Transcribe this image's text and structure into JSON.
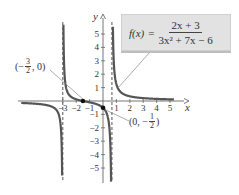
{
  "chart_data": {
    "type": "line",
    "title": "",
    "function_label": {
      "lhs": "f(x)",
      "equals": "=",
      "numerator": "2x + 3",
      "denominator": "3x² + 7x − 6"
    },
    "xlabel": "x",
    "ylabel": "y",
    "xlim": [
      -6,
      6
    ],
    "ylim": [
      -6,
      6
    ],
    "x_ticks": [
      -3,
      -2,
      -1,
      1,
      2,
      3,
      4,
      5
    ],
    "x_tick_labels": [
      "−3",
      "−2",
      "−1",
      "1",
      "2",
      "3",
      "4",
      "5"
    ],
    "y_ticks": [
      5,
      4,
      3,
      2,
      1,
      -1,
      -2,
      -3,
      -4,
      -5
    ],
    "y_tick_labels": [
      "5",
      "4",
      "3",
      "2",
      "1",
      "−1",
      "−2",
      "−3",
      "−4",
      "−5"
    ],
    "vertical_asymptotes": [
      -3,
      0.6667
    ],
    "horizontal_asymptote": 0,
    "grid": false,
    "series": [
      {
        "name": "left branch",
        "domain": [
          -6.1,
          -3
        ],
        "points": [
          [
            -6,
            -0.117
          ],
          [
            -5,
            -0.184
          ],
          [
            -4,
            -0.5
          ],
          [
            -3.5,
            -1.2
          ],
          [
            -3.3,
            -2.4
          ],
          [
            -3.15,
            -5.4
          ]
        ]
      },
      {
        "name": "middle branch",
        "domain": [
          -3,
          0.6667
        ],
        "points": [
          [
            -2.85,
            5.5
          ],
          [
            -2.5,
            1.14
          ],
          [
            -2,
            0.125
          ],
          [
            -1.5,
            0
          ],
          [
            -1,
            -0.1
          ],
          [
            0,
            -0.5
          ],
          [
            0.5,
            -2.67
          ],
          [
            0.6,
            -6.3
          ]
        ]
      },
      {
        "name": "right branch",
        "domain": [
          0.6667,
          5.3
        ],
        "points": [
          [
            0.75,
            5.4
          ],
          [
            1,
            1.25
          ],
          [
            2,
            0.35
          ],
          [
            3,
            0.214
          ],
          [
            4,
            0.15
          ],
          [
            5,
            0.114
          ]
        ]
      }
    ],
    "annotations": [
      {
        "label": "(−3/2, 0)",
        "x": -1.5,
        "y": 0,
        "text_parts": {
          "open": "(−",
          "num": "3",
          "den": "2",
          "close": ", 0)"
        }
      },
      {
        "label": "(0, −1/2)",
        "x": 0,
        "y": -0.5,
        "text_parts": {
          "open": "(0, −",
          "num": "1",
          "den": "2",
          "close": ")"
        }
      }
    ],
    "colors": {
      "curve": "#555555",
      "axis": "#666666",
      "asymptote": "#555555",
      "box_bg": "#e2e2e2",
      "leader": "#888888"
    }
  }
}
